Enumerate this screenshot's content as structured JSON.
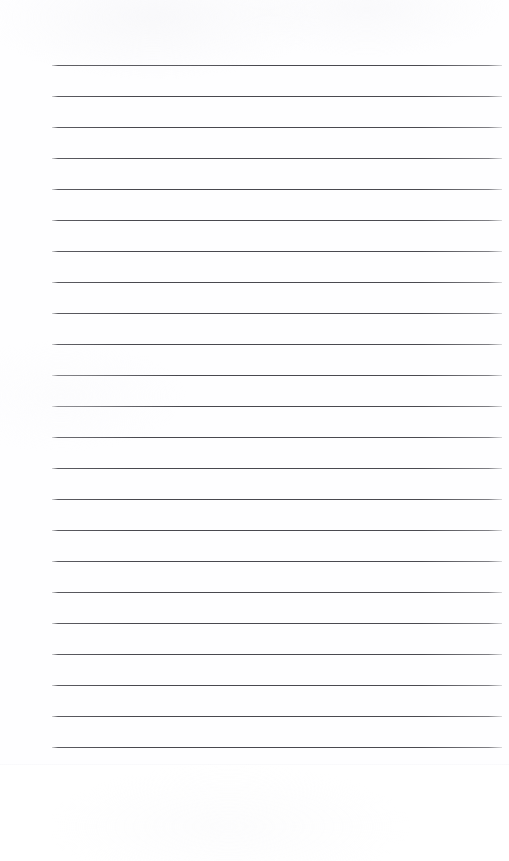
{
  "document": {
    "kind": "scanned-ruled-paper",
    "description": "Blank scanned sheet of ruled notebook paper",
    "written_content": "",
    "visible_text": "",
    "page_width_px": 509,
    "page_height_px": 861
  },
  "colors": {
    "page_background": "#ffffff",
    "paper": "#fefeff",
    "rule_line": "#4a4a50",
    "paper_edge": "#f0f0f4"
  },
  "paper": {
    "sheet_top_px": 0,
    "sheet_bottom_px": 765,
    "below_sheet_top_px": 765,
    "below_sheet_height_px": 96,
    "bottom_edge_y_px": 764
  },
  "ruling": {
    "line_count": 23,
    "first_line_y_px": 65,
    "last_line_y_px": 747,
    "line_spacing_px": 31,
    "line_left_px": 52,
    "line_right_px": 502,
    "line_width_px": 450,
    "line_thickness_px": 1,
    "margin_rule": "none",
    "header_rule": "none",
    "lines": [
      {
        "index": 1,
        "y": 65
      },
      {
        "index": 2,
        "y": 96
      },
      {
        "index": 3,
        "y": 127
      },
      {
        "index": 4,
        "y": 158
      },
      {
        "index": 5,
        "y": 189
      },
      {
        "index": 6,
        "y": 220
      },
      {
        "index": 7,
        "y": 251
      },
      {
        "index": 8,
        "y": 282
      },
      {
        "index": 9,
        "y": 313
      },
      {
        "index": 10,
        "y": 344
      },
      {
        "index": 11,
        "y": 375
      },
      {
        "index": 12,
        "y": 406
      },
      {
        "index": 13,
        "y": 437
      },
      {
        "index": 14,
        "y": 468
      },
      {
        "index": 15,
        "y": 499
      },
      {
        "index": 16,
        "y": 530
      },
      {
        "index": 17,
        "y": 561
      },
      {
        "index": 18,
        "y": 592
      },
      {
        "index": 19,
        "y": 623
      },
      {
        "index": 20,
        "y": 654
      },
      {
        "index": 21,
        "y": 685
      },
      {
        "index": 22,
        "y": 716
      },
      {
        "index": 23,
        "y": 747
      }
    ]
  }
}
